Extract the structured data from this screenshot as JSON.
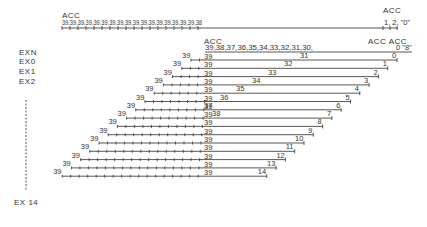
{
  "figure": {
    "top_row": {
      "acc_label": "ACC",
      "values": "39,39,39,39,39,39,39,39,39,39,39,39,39,39,39,39,39,38",
      "right_acc_label": "ACC",
      "right_values": "1, 2, \"0\""
    },
    "mid_acc_label": "ACC",
    "right_acc_labels": "ACC ACC",
    "left_labels": [
      "EXN",
      "EX0",
      "EX1",
      "EX2",
      "EX 14"
    ],
    "exn_row": {
      "values": "39,38,37,36,35,34,33,32,31,30,",
      "right_values": "0 \"8\""
    },
    "rows": [
      {
        "left": "39",
        "center": "39",
        "mid": "31",
        "end": "0"
      },
      {
        "left": "39",
        "center": "39",
        "mid": "32",
        "end": "1"
      },
      {
        "left": "39",
        "center": "39",
        "mid": "33",
        "end": "2"
      },
      {
        "left": "39",
        "center": "39",
        "mid": "34",
        "end": "3"
      },
      {
        "left": "39",
        "center": "39",
        "mid": "35",
        "end": "4"
      },
      {
        "left": "39",
        "center": "39",
        "mid": "36",
        "end": "5"
      },
      {
        "left": "39",
        "center": "39",
        "mid": "37",
        "end": "6"
      },
      {
        "left": "39",
        "center": "39",
        "mid": "38",
        "end": "7"
      },
      {
        "left": "39",
        "center": "39",
        "mid": "",
        "end": "8"
      },
      {
        "left": "39",
        "center": "39",
        "mid": "",
        "end": "9"
      },
      {
        "left": "39",
        "center": "39",
        "mid": "",
        "end": "10"
      },
      {
        "left": "39",
        "center": "39",
        "mid": "",
        "end": "11"
      },
      {
        "left": "39",
        "center": "39",
        "mid": "",
        "end": "12"
      },
      {
        "left": "39",
        "center": "39",
        "mid": "",
        "end": "13"
      },
      {
        "left": "39",
        "center": "39",
        "mid": "",
        "end": "14"
      }
    ]
  }
}
